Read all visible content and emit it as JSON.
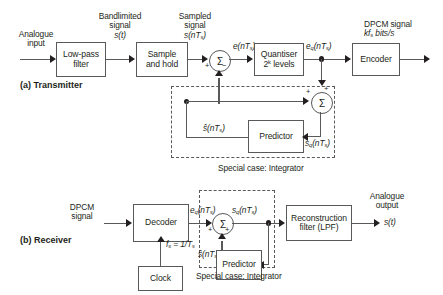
{
  "figure": {
    "sections": [
      {
        "key": "transmitter",
        "label": "(a) Transmitter"
      },
      {
        "key": "receiver",
        "label": "(b) Receiver"
      }
    ]
  },
  "transmitter": {
    "input_label_line1": "Analogue",
    "input_label_line2": "input",
    "blocks": {
      "lowpass": "Low-pass\nfilter",
      "lowpass_line1": "Low-pass",
      "lowpass_line2": "filter",
      "sample_hold_line1": "Sample",
      "sample_hold_line2": "and hold",
      "quantiser_line1": "Quantiser",
      "quantiser_line2_pre": "2",
      "quantiser_line2_sup": "k",
      "quantiser_line2_post": " levels",
      "encoder": "Encoder",
      "predictor": "Predictor"
    },
    "signals": {
      "bandlimited_line1": "Bandlimited",
      "bandlimited_line2": "signal",
      "bandlimited_line3": "s(t)",
      "sampled_line1": "Sampled",
      "sampled_line2": "signal",
      "sampled_line3_pre": "s(nT",
      "sampled_line3_sub": "s",
      "sampled_line3_post": ")",
      "error_pre": "e(nT",
      "error_sub": "s",
      "error_post": ")",
      "quant_error_pre": "e",
      "quant_error_subq": "q",
      "quant_error_mid": "(nT",
      "quant_error_subs": "s",
      "quant_error_post": ")",
      "output_line1": "DPCM signal",
      "output_line2_pre": "kf",
      "output_line2_sub": "s",
      "output_line2_post": " bits/s",
      "pred_out_pre": "ŝ(nT",
      "pred_out_sub": "s",
      "pred_out_post": ")",
      "recon_pre": "s",
      "recon_subq": "q",
      "recon_mid": "(nT",
      "recon_subs": "s",
      "recon_post": ")"
    },
    "sum1_signs": {
      "left": "+",
      "bottom": "−"
    },
    "sum2_signs": {
      "left": "+",
      "top": "+"
    },
    "special_case": "Special case: Integrator"
  },
  "receiver": {
    "input_line1": "DPCM",
    "input_line2": "signal",
    "blocks": {
      "decoder": "Decoder",
      "clock": "Clock",
      "predictor": "Predictor",
      "recon_line1": "Reconstruction",
      "recon_line2": "filter (LPF)"
    },
    "signals": {
      "quant_error_pre": "e",
      "quant_error_subq": "q",
      "quant_error_mid": "(nT",
      "quant_error_subs": "s",
      "quant_error_post": ")",
      "clock_pre": "f",
      "clock_sub1": "s",
      "clock_mid": " = 1/T",
      "clock_sub2": "s",
      "recon_pre": "s",
      "recon_subq": "q",
      "recon_mid": "(nT",
      "recon_subs": "s",
      "recon_post": ")",
      "pred_out_pre": "ŝ(nT",
      "pred_out_sub": "s",
      "pred_out_post": ")",
      "output_line1": "Analogue",
      "output_line2": "output",
      "output_line3": "s(t)"
    },
    "sum_signs": {
      "left": "+",
      "bottom": "+"
    },
    "special_case": "Special case: Integrator"
  },
  "colors": {
    "stroke": "#58595b",
    "ink": "#231f20",
    "background": "#ffffff"
  }
}
